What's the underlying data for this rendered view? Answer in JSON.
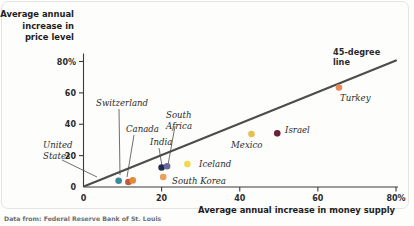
{
  "figure": {
    "source_note": "Data from: Federal Reserve Bank of St. Louis"
  },
  "chart_data": {
    "type": "scatter",
    "title": "",
    "ylabel": "Average annual increase in price level",
    "xlabel": "Average annual increase in money supply",
    "xlim": [
      0,
      80
    ],
    "ylim": [
      0,
      88
    ],
    "grid": false,
    "legend": "none",
    "xticks": [
      0,
      20,
      40,
      60,
      80
    ],
    "xticklabels": [
      "0",
      "20",
      "40",
      "60",
      "80%"
    ],
    "yticks": [
      0,
      20,
      40,
      60,
      80
    ],
    "yticklabels": [
      "0",
      "20",
      "40",
      "60",
      "80%"
    ],
    "reference_line": {
      "name": "45-degree line",
      "label": "45-degree\nline",
      "label_line1": "45-degree",
      "label_line2": "line",
      "slope": 1,
      "intercept": 0,
      "color": "#4c4c4c"
    },
    "points": [
      {
        "name": "United States",
        "x": 9.0,
        "y": 4.0,
        "color": "#3b8a9c"
      },
      {
        "name": "Switzerland",
        "x": 11.5,
        "y": 3.2,
        "color": "#c4553a"
      },
      {
        "name": "Canada",
        "x": 12.6,
        "y": 4.2,
        "color": "#e08a3c"
      },
      {
        "name": "India",
        "x": 20.0,
        "y": 12.4,
        "color": "#1f2d52"
      },
      {
        "name": "South Africa",
        "x": 21.4,
        "y": 13.2,
        "color": "#6b6a9e"
      },
      {
        "name": "South Korea",
        "x": 20.4,
        "y": 6.4,
        "color": "#e8a15a"
      },
      {
        "name": "Iceland",
        "x": 26.6,
        "y": 14.6,
        "color": "#f2d94e"
      },
      {
        "name": "Mexico",
        "x": 43.0,
        "y": 33.8,
        "color": "#e7bf4d"
      },
      {
        "name": "Israel",
        "x": 49.6,
        "y": 34.2,
        "color": "#6b1f3a"
      },
      {
        "name": "Turkey",
        "x": 65.4,
        "y": 63.4,
        "color": "#e8875c"
      }
    ]
  }
}
